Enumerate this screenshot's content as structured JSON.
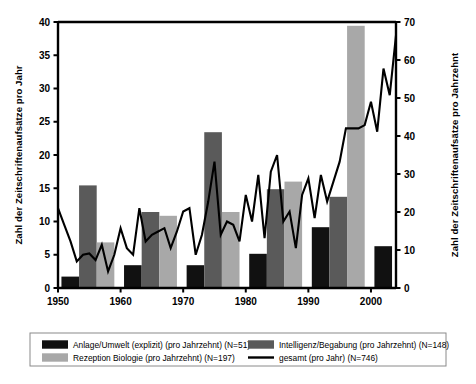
{
  "chart_data": {
    "type": "bar",
    "title": "",
    "xlabel": "",
    "ylabel": "Zahl der Zeitschriftenaufsätze pro Jahr",
    "y2label": "Zahl der Zeitschriftenaufsätze pro Jahrzehnt",
    "ylim": [
      0,
      40
    ],
    "y2lim": [
      0,
      70
    ],
    "yticks": [
      0,
      5,
      10,
      15,
      20,
      25,
      30,
      35,
      40
    ],
    "y2ticks": [
      0,
      10,
      20,
      30,
      40,
      50,
      60,
      70
    ],
    "xlim": [
      1950,
      2004
    ],
    "xticks": [
      1950,
      1960,
      1970,
      1980,
      1990,
      2000
    ],
    "grid": false,
    "legend_position": "bottom",
    "decades": [
      1950,
      1960,
      1970,
      1980,
      1990,
      2000
    ],
    "series": [
      {
        "name": "Anlage/Umwelt (explizit) (pro Jahrzehnt) (N=51)",
        "kind": "bar",
        "color": "#111111",
        "axis": "right",
        "values": [
          3,
          6,
          6,
          9,
          16,
          11
        ]
      },
      {
        "name": "Intelligenz/Begabung (pro Jahrzehnt) (N=148)",
        "kind": "bar",
        "color": "#5a5a5a",
        "axis": "right",
        "values": [
          27,
          20,
          41,
          26,
          24,
          10
        ]
      },
      {
        "name": "Rezeption Biologie (pro Jahrzehnt) (N=197)",
        "kind": "bar",
        "color": "#a8a8a8",
        "axis": "right",
        "values": [
          12,
          19,
          20,
          28,
          69,
          40
        ]
      },
      {
        "name": "gesamt (pro Jahr) (N=746)",
        "kind": "line",
        "color": "#000000",
        "axis": "left",
        "x": [
          1950,
          1951,
          1952,
          1953,
          1954,
          1955,
          1956,
          1957,
          1958,
          1959,
          1960,
          1961,
          1962,
          1963,
          1964,
          1965,
          1966,
          1967,
          1968,
          1969,
          1970,
          1971,
          1972,
          1973,
          1974,
          1975,
          1976,
          1977,
          1978,
          1979,
          1980,
          1981,
          1982,
          1983,
          1984,
          1985,
          1986,
          1987,
          1988,
          1989,
          1990,
          1991,
          1992,
          1993,
          1994,
          1995,
          1996,
          1997,
          1998,
          1999,
          2000,
          2001,
          2002,
          2003,
          2004
        ],
        "values": [
          12,
          9.5,
          7,
          4,
          5,
          5.2,
          4.2,
          6.5,
          2.5,
          5,
          9,
          6,
          5,
          12,
          7,
          8,
          8.5,
          9,
          6,
          8.5,
          11.5,
          12,
          5,
          8,
          13,
          19,
          8,
          10,
          9.5,
          7,
          14,
          10,
          17,
          7.5,
          17.5,
          20,
          10,
          11.5,
          6,
          14,
          16.5,
          10.5,
          17,
          13,
          16,
          19,
          24,
          24,
          24,
          24.5,
          28,
          23.5,
          33,
          29,
          38
        ]
      }
    ]
  },
  "legend": {
    "items": [
      {
        "label": "Anlage/Umwelt (explizit) (pro Jahrzehnt) (N=51)",
        "swatch": "#111111",
        "type": "box"
      },
      {
        "label": "Intelligenz/Begabung (pro Jahrzehnt) (N=148)",
        "swatch": "#5a5a5a",
        "type": "box"
      },
      {
        "label": "Rezeption Biologie (pro Jahrzehnt) (N=197)",
        "swatch": "#a8a8a8",
        "type": "box"
      },
      {
        "label": "gesamt (pro Jahr) (N=746)",
        "swatch": "#000000",
        "type": "line"
      }
    ]
  }
}
